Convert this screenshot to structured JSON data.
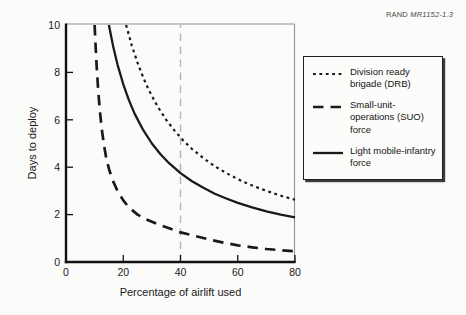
{
  "rand_note": {
    "publisher": "RAND",
    "doc_id": "MR1152-1.3"
  },
  "chart_data": {
    "type": "line",
    "title": "",
    "xlabel": "Percentage of airlift used",
    "ylabel": "Days to deploy",
    "xlim": [
      0,
      80
    ],
    "ylim": [
      0,
      10
    ],
    "xticks": [
      0,
      20,
      40,
      60,
      80
    ],
    "yticks": [
      0,
      2,
      4,
      6,
      8,
      10
    ],
    "grid": false,
    "reference_line_x": 40,
    "legend_position": "right-outside",
    "series": [
      {
        "name": "Division ready brigade (DRB)",
        "style": "dotted",
        "points": [
          [
            21,
            10
          ],
          [
            23,
            9.13
          ],
          [
            25,
            8.4
          ],
          [
            27,
            7.78
          ],
          [
            29,
            7.24
          ],
          [
            32,
            6.56
          ],
          [
            35,
            6.0
          ],
          [
            38,
            5.53
          ],
          [
            41,
            5.12
          ],
          [
            44,
            4.77
          ],
          [
            48,
            4.38
          ],
          [
            52,
            4.04
          ],
          [
            56,
            3.75
          ],
          [
            60,
            3.5
          ],
          [
            64,
            3.28
          ],
          [
            68,
            3.09
          ],
          [
            72,
            2.92
          ],
          [
            76,
            2.76
          ],
          [
            80,
            2.63
          ]
        ]
      },
      {
        "name": "Small-unit-operations (SUO) force",
        "style": "dashed",
        "points": [
          [
            10,
            10
          ],
          [
            10.3,
            9.2
          ],
          [
            10.7,
            8.3
          ],
          [
            11.2,
            7.3
          ],
          [
            11.8,
            6.4
          ],
          [
            12.5,
            5.6
          ],
          [
            13.3,
            4.9
          ],
          [
            14.2,
            4.3
          ],
          [
            15.2,
            3.85
          ],
          [
            16.5,
            3.4
          ],
          [
            18,
            3.0
          ],
          [
            20,
            2.6
          ],
          [
            22,
            2.3
          ],
          [
            25,
            2.0
          ],
          [
            28,
            1.8
          ],
          [
            32,
            1.6
          ],
          [
            36,
            1.42
          ],
          [
            40,
            1.25
          ],
          [
            45,
            1.1
          ],
          [
            50,
            0.95
          ],
          [
            55,
            0.82
          ],
          [
            60,
            0.7
          ],
          [
            65,
            0.62
          ],
          [
            70,
            0.55
          ],
          [
            75,
            0.5
          ],
          [
            80,
            0.45
          ]
        ]
      },
      {
        "name": "Light mobile-infantry force",
        "style": "solid",
        "points": [
          [
            15,
            10
          ],
          [
            16.5,
            9.09
          ],
          [
            18,
            8.33
          ],
          [
            20,
            7.5
          ],
          [
            22,
            6.82
          ],
          [
            24,
            6.25
          ],
          [
            27,
            5.56
          ],
          [
            30,
            5.0
          ],
          [
            33,
            4.55
          ],
          [
            36,
            4.17
          ],
          [
            40,
            3.75
          ],
          [
            44,
            3.41
          ],
          [
            48,
            3.13
          ],
          [
            52,
            2.88
          ],
          [
            56,
            2.68
          ],
          [
            60,
            2.5
          ],
          [
            65,
            2.31
          ],
          [
            70,
            2.14
          ],
          [
            75,
            2.0
          ],
          [
            80,
            1.88
          ]
        ]
      }
    ]
  },
  "legend": {
    "items": [
      {
        "label": "Division ready brigade (DRB)",
        "style": "dotted",
        "lines": [
          "Division ready",
          "brigade (DRB)"
        ]
      },
      {
        "label": "Small-unit-operations (SUO) force",
        "style": "dashed",
        "lines": [
          "Small-unit-",
          "operations (SUO)",
          "force"
        ]
      },
      {
        "label": "Light mobile-infantry force",
        "style": "solid",
        "lines": [
          "Light mobile-infantry",
          "force"
        ]
      }
    ]
  },
  "colors": {
    "curve": "#1a1a1a",
    "reference_line": "#b4b4b4",
    "frame_light": "#8f8f8f",
    "background": "#fbfbfa"
  }
}
